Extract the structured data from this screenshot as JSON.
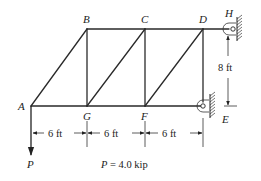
{
  "diagram": {
    "type": "planar-truss",
    "nodes": {
      "A": {
        "label": "A",
        "x": 31,
        "y": 106
      },
      "B": {
        "label": "B",
        "x": 87,
        "y": 29
      },
      "C": {
        "label": "C",
        "x": 145,
        "y": 29
      },
      "D": {
        "label": "D",
        "x": 203,
        "y": 29
      },
      "G": {
        "label": "G",
        "x": 87,
        "y": 106
      },
      "F": {
        "label": "F",
        "x": 145,
        "y": 106
      },
      "H": {
        "label": "H"
      },
      "E": {
        "label": "E"
      }
    },
    "members": [
      [
        "A",
        "B"
      ],
      [
        "B",
        "C"
      ],
      [
        "C",
        "D"
      ],
      [
        "A",
        "G"
      ],
      [
        "G",
        "F"
      ],
      [
        "F",
        "E"
      ],
      [
        "B",
        "G"
      ],
      [
        "C",
        "F"
      ],
      [
        "D",
        "E"
      ],
      [
        "G",
        "C"
      ],
      [
        "F",
        "D"
      ],
      [
        "D",
        "H"
      ]
    ],
    "supports": [
      {
        "node": "H",
        "type": "pin-to-wall",
        "side": "right"
      },
      {
        "node": "E",
        "type": "pin-to-wall",
        "side": "right"
      }
    ],
    "load": {
      "node": "A",
      "symbol": "P",
      "direction": "down"
    },
    "dimensions": {
      "horizontal": [
        "6 ft",
        "6 ft",
        "6 ft"
      ],
      "vertical": "8 ft"
    },
    "caption": {
      "symbol": "P",
      "equals": " = 4.0 kip"
    }
  }
}
